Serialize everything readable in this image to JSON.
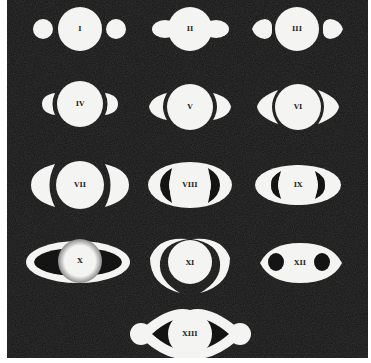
{
  "image": {
    "subject": "Huygens' drawings of the appearances of Saturn",
    "background_color": "#141414",
    "figure_color": "#f4f4f2",
    "figures": [
      {
        "label": "I"
      },
      {
        "label": "II"
      },
      {
        "label": "III"
      },
      {
        "label": "IV"
      },
      {
        "label": "V"
      },
      {
        "label": "VI"
      },
      {
        "label": "VII"
      },
      {
        "label": "VIII"
      },
      {
        "label": "IX"
      },
      {
        "label": "X"
      },
      {
        "label": "XI"
      },
      {
        "label": "XII"
      },
      {
        "label": "XIII"
      }
    ]
  }
}
